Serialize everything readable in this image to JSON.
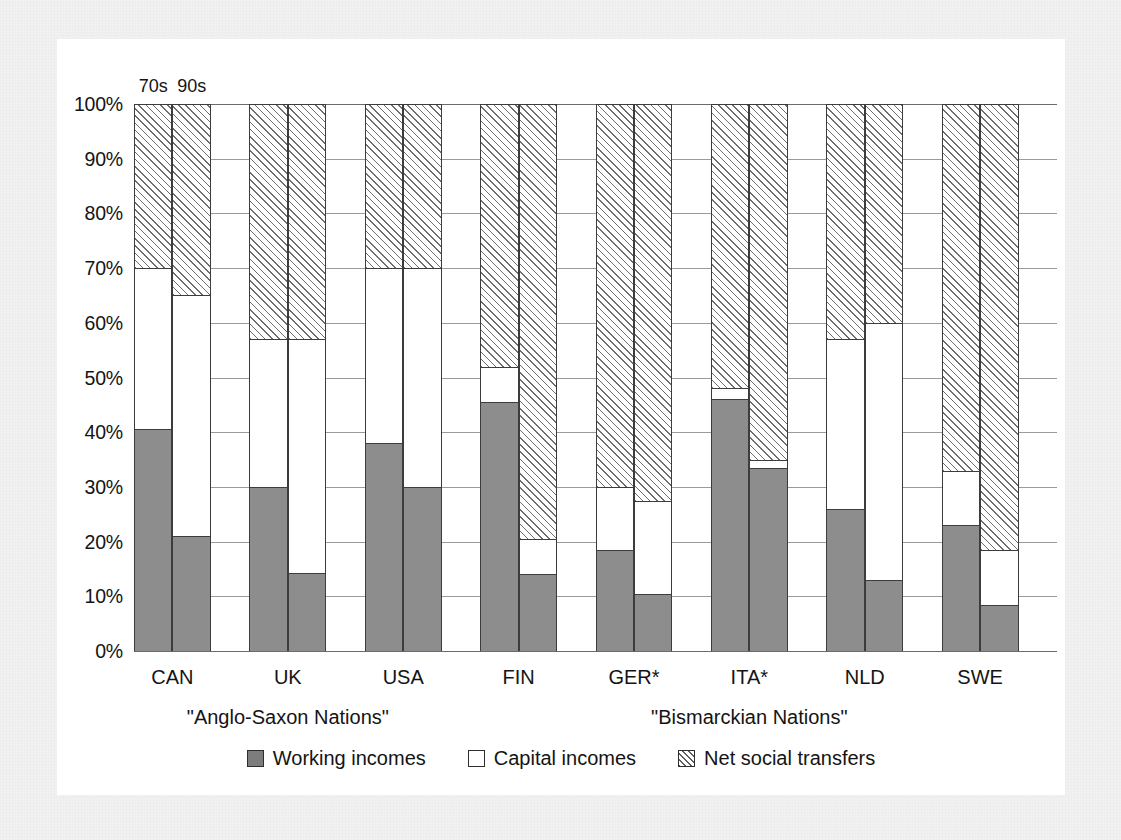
{
  "chart_data": {
    "type": "bar",
    "subtype": "stacked-100-percent",
    "title": "",
    "xlabel": "",
    "ylabel": "",
    "ylim": [
      0,
      100
    ],
    "ytick_labels": [
      "0%",
      "10%",
      "20%",
      "30%",
      "40%",
      "50%",
      "60%",
      "70%",
      "80%",
      "90%",
      "100%"
    ],
    "ytick_values": [
      0,
      10,
      20,
      30,
      40,
      50,
      60,
      70,
      80,
      90,
      100
    ],
    "grid": true,
    "legend_position": "bottom-center",
    "period_labels": [
      "70s",
      "90s"
    ],
    "categories": [
      "CAN",
      "UK",
      "USA",
      "FIN",
      "GER*",
      "ITA*",
      "NLD",
      "SWE"
    ],
    "group_labels": [
      {
        "text": "\"Anglo-Saxon Nations\"",
        "categories": [
          "CAN",
          "UK",
          "USA"
        ]
      },
      {
        "text": "\"Bismarckian Nations\"",
        "categories": [
          "FIN",
          "GER*",
          "ITA*",
          "NLD",
          "SWE"
        ]
      }
    ],
    "series": [
      {
        "name": "Working incomes",
        "key": "working",
        "fill": "solid-gray",
        "color": "#8d8d8d"
      },
      {
        "name": "Capital incomes",
        "key": "capital",
        "fill": "white",
        "color": "#ffffff"
      },
      {
        "name": "Net social transfers",
        "key": "transfers",
        "fill": "hatched-diagonal",
        "color": "#ffffff"
      }
    ],
    "bars": [
      {
        "category": "CAN",
        "period": "70s",
        "working": 40.5,
        "capital": 29.5,
        "transfers": 30.0
      },
      {
        "category": "CAN",
        "period": "90s",
        "working": 21.0,
        "capital": 44.0,
        "transfers": 35.0
      },
      {
        "category": "UK",
        "period": "70s",
        "working": 30.0,
        "capital": 27.0,
        "transfers": 43.0
      },
      {
        "category": "UK",
        "period": "90s",
        "working": 14.3,
        "capital": 42.7,
        "transfers": 43.0
      },
      {
        "category": "USA",
        "period": "70s",
        "working": 38.0,
        "capital": 32.0,
        "transfers": 30.0
      },
      {
        "category": "USA",
        "period": "90s",
        "working": 30.0,
        "capital": 40.0,
        "transfers": 30.0
      },
      {
        "category": "FIN",
        "period": "70s",
        "working": 45.5,
        "capital": 6.5,
        "transfers": 48.0
      },
      {
        "category": "FIN",
        "period": "90s",
        "working": 14.0,
        "capital": 6.5,
        "transfers": 79.5
      },
      {
        "category": "GER*",
        "period": "70s",
        "working": 18.5,
        "capital": 11.5,
        "transfers": 70.0
      },
      {
        "category": "GER*",
        "period": "90s",
        "working": 10.5,
        "capital": 17.0,
        "transfers": 72.5
      },
      {
        "category": "ITA*",
        "period": "70s",
        "working": 46.0,
        "capital": 2.0,
        "transfers": 52.0
      },
      {
        "category": "ITA*",
        "period": "90s",
        "working": 33.5,
        "capital": 1.5,
        "transfers": 65.0
      },
      {
        "category": "NLD",
        "period": "70s",
        "working": 26.0,
        "capital": 31.0,
        "transfers": 43.0
      },
      {
        "category": "NLD",
        "period": "90s",
        "working": 13.0,
        "capital": 47.0,
        "transfers": 40.0
      },
      {
        "category": "SWE",
        "period": "70s",
        "working": 23.0,
        "capital": 10.0,
        "transfers": 67.0
      },
      {
        "category": "SWE",
        "period": "90s",
        "working": 8.5,
        "capital": 10.0,
        "transfers": 81.5
      }
    ]
  },
  "legend": {
    "items": [
      {
        "label": "Working incomes",
        "swatch": "solid-gray-swatch-icon"
      },
      {
        "label": "Capital incomes",
        "swatch": "white-swatch-icon"
      },
      {
        "label": "Net social transfers",
        "swatch": "hatched-swatch-icon"
      }
    ]
  },
  "colors": {
    "working": "#8d8d8d",
    "capital": "#ffffff",
    "transfers_hatch": "#6e6e6e",
    "axis": "#6b6b6b",
    "grid": "#9a9a9a",
    "text": "#141414",
    "page_background": "#f1f1f1",
    "figure_background": "#ffffff"
  }
}
